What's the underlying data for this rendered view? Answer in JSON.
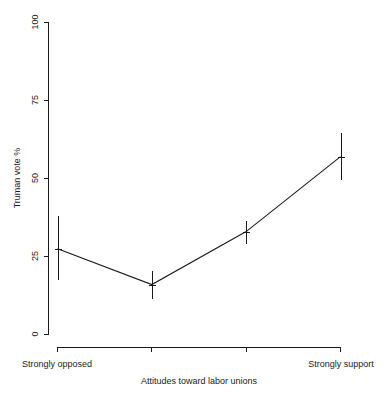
{
  "chart_data": {
    "type": "line",
    "title": "",
    "subtitle": "",
    "xlabel": "Attitudes toward labor unions",
    "ylabel": "Truman vote %",
    "ylim": [
      0,
      100
    ],
    "yticks": [
      0,
      25,
      50,
      75,
      100
    ],
    "ytick_labels": [
      "0",
      "25",
      "50",
      "75",
      "100"
    ],
    "xlim": [
      1,
      4
    ],
    "xticks": [
      1,
      2,
      3,
      4
    ],
    "xtick_labels": [
      "",
      "",
      "",
      ""
    ],
    "categories": [
      "Strongly opposed",
      "",
      "",
      "Strongly support"
    ],
    "x": [
      1,
      2,
      3,
      4
    ],
    "values": [
      27.5,
      16.0,
      33.0,
      57.0
    ],
    "error_low": [
      17.5,
      11.5,
      29.0,
      49.5
    ],
    "error_high": [
      38.0,
      20.5,
      36.5,
      64.5
    ],
    "grid": false,
    "legend": null,
    "series": [
      {
        "name": "Truman vote %",
        "values": [
          27.5,
          16.0,
          33.0,
          57.0
        ]
      }
    ],
    "annotations": [],
    "style": {
      "line_color": "#1a1a1a",
      "background": "#ffffff",
      "axis_color": "#1a1a1a"
    }
  },
  "axes": {
    "y_title": "Truman vote %",
    "x_title": "Attitudes toward labor unions",
    "y_tick_0": "0",
    "y_tick_1": "25",
    "y_tick_2": "50",
    "y_tick_3": "75",
    "y_tick_4": "100",
    "x_label_left": "Strongly opposed",
    "x_label_right": "Strongly support"
  }
}
